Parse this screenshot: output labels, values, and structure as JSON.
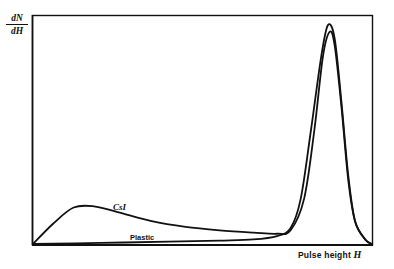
{
  "chart_data": {
    "type": "line",
    "title": "",
    "xlabel": "Pulse height",
    "xlabel_var": "H",
    "ylabel_num": "dN",
    "ylabel_den": "dH",
    "ylabel": "dN/dH",
    "x_ticks": [],
    "y_ticks": [],
    "grid": false,
    "legend": "inline labels on curves",
    "xlim": [
      0,
      1
    ],
    "ylim": [
      0,
      1
    ],
    "series": [
      {
        "name": "CsI",
        "x": [
          0.0,
          0.06,
          0.12,
          0.18,
          0.25,
          0.35,
          0.45,
          0.55,
          0.65,
          0.72,
          0.76,
          0.8,
          0.83,
          0.855,
          0.875,
          0.89,
          0.91,
          0.93,
          0.95,
          0.98,
          1.0
        ],
        "y": [
          0.0,
          0.09,
          0.16,
          0.165,
          0.14,
          0.1,
          0.075,
          0.06,
          0.05,
          0.045,
          0.06,
          0.2,
          0.5,
          0.82,
          0.93,
          0.87,
          0.6,
          0.28,
          0.1,
          0.02,
          0.0
        ]
      },
      {
        "name": "Plastic",
        "x": [
          0.0,
          0.2,
          0.4,
          0.55,
          0.65,
          0.72,
          0.76,
          0.79,
          0.82,
          0.85,
          0.87,
          0.89,
          0.91,
          0.93,
          0.95,
          0.98,
          1.0
        ],
        "y": [
          0.0,
          0.005,
          0.01,
          0.015,
          0.02,
          0.035,
          0.07,
          0.2,
          0.5,
          0.82,
          0.96,
          0.9,
          0.62,
          0.3,
          0.1,
          0.02,
          0.0
        ]
      }
    ],
    "annotations": [
      "CsI",
      "Plastic"
    ]
  },
  "labels": {
    "csi": "CsI",
    "plastic": "Plastic"
  }
}
